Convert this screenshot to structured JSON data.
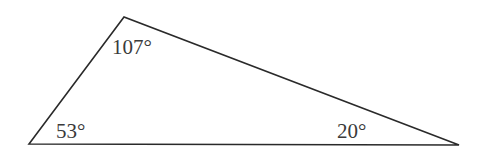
{
  "diagram": {
    "type": "triangle",
    "stroke_color": "#2a2a2a",
    "text_color": "#3a3a3a",
    "vertices": {
      "bottom_left": {
        "x": 29,
        "y": 144
      },
      "top": {
        "x": 124,
        "y": 17
      },
      "bottom_right": {
        "x": 459,
        "y": 145
      }
    },
    "angles": {
      "top": {
        "label": "107°",
        "x": 112,
        "y": 54
      },
      "bottom_left": {
        "label": "53°",
        "x": 56,
        "y": 138
      },
      "bottom_right": {
        "label": "20°",
        "x": 337,
        "y": 138
      }
    }
  }
}
